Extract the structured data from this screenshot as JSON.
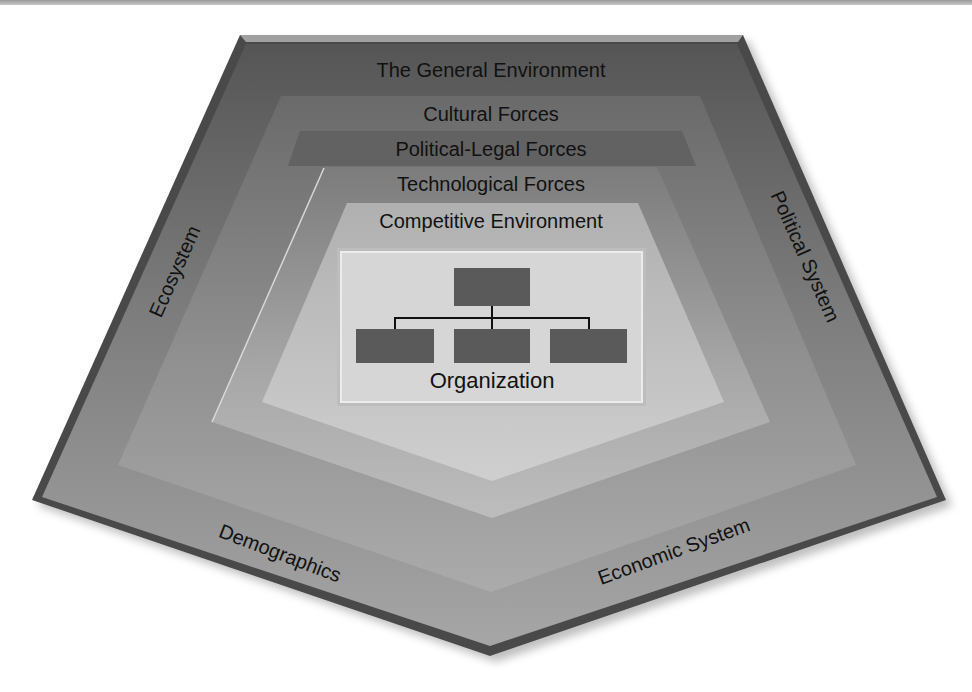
{
  "title": "The General Environment",
  "layers": {
    "general": "The General Environment",
    "cultural": "Cultural Forces",
    "political_legal": "Political-Legal Forces",
    "technological": "Technological Forces",
    "competitive": "Competitive Environment",
    "organization": "Organization"
  },
  "outer_labels": {
    "left": "Ecosystem",
    "right": "Political System",
    "bottom_left": "Demographics",
    "bottom_right": "Economic System"
  },
  "org_chart": {
    "icon": "org-chart-icon",
    "top_boxes": 1,
    "bottom_boxes": 3
  },
  "colors": {
    "outer_rim": "#4a4a4a",
    "general": "#5c5c5c",
    "cultural": "#707070",
    "political_legal": "#666666",
    "technological": "#8a8a8a",
    "competitive": "#b4b4b4",
    "organization_box": "#d4d4d4",
    "org_node": "#5a5a5a"
  }
}
